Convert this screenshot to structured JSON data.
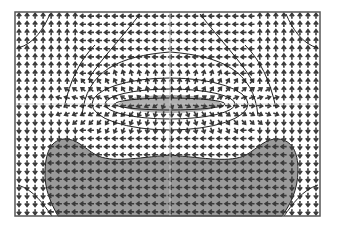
{
  "figure": {
    "type": "vector-field-plot",
    "frame": {
      "x": 15,
      "y": 12,
      "width": 305,
      "height": 204
    },
    "colors": {
      "background": "#ffffff",
      "frame": "#555555",
      "arrow": "#3a3a3a",
      "contour": "#222222",
      "shaded_region": "#9a9a9a",
      "inner_lens": "#b0b0b0",
      "midline": "#c8c8c8"
    },
    "grid": {
      "cols": 38,
      "rows": 25
    },
    "regions": [
      {
        "name": "top-left-vortex"
      },
      {
        "name": "top-right-vortex"
      },
      {
        "name": "central-elliptic-cell"
      },
      {
        "name": "bottom-shaded-lobe"
      },
      {
        "name": "bottom-left-vortex"
      },
      {
        "name": "bottom-right-vortex"
      }
    ]
  }
}
